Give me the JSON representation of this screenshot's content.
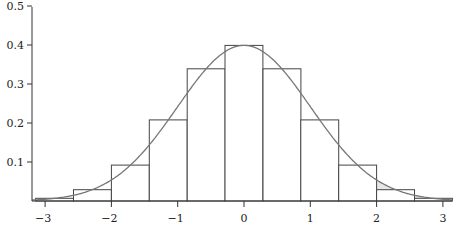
{
  "chart_data": {
    "type": "bar",
    "title": "",
    "xlabel": "",
    "ylabel": "",
    "bin_width": 0.5714,
    "bin_edges": [
      -3.143,
      -2.571,
      -2.0,
      -1.429,
      -0.857,
      -0.286,
      0.286,
      0.857,
      1.429,
      2.0,
      2.571,
      3.143
    ],
    "categories": [
      "-2.857",
      "-2.286",
      "-1.714",
      "-1.143",
      "-0.571",
      "0",
      "0.571",
      "1.143",
      "1.714",
      "2.286",
      "2.857"
    ],
    "values": [
      0.007,
      0.029,
      0.092,
      0.208,
      0.339,
      0.399,
      0.339,
      0.208,
      0.092,
      0.029,
      0.007
    ],
    "curve": {
      "name": "Normal density N(0,1)",
      "peak": 0.399
    },
    "shaded_region": {
      "from": 2.0,
      "to": 3.143,
      "color": "#e6e6e6"
    },
    "xlim": [
      -3.2,
      3.15
    ],
    "ylim": [
      0,
      0.5
    ],
    "x_ticks": [
      "−3",
      "−2",
      "−1",
      "0",
      "1",
      "2",
      "3"
    ],
    "x_tick_values": [
      -3,
      -2,
      -1,
      0,
      1,
      2,
      3
    ],
    "y_ticks": [
      "0.1",
      "0.2",
      "0.3",
      "0.4",
      "0.5"
    ],
    "y_tick_values": [
      0.1,
      0.2,
      0.3,
      0.4,
      0.5
    ],
    "grid": false,
    "legend": null,
    "colors": {
      "bar_stroke": "#444444",
      "bar_fill": "#ffffff",
      "curve": "#777777",
      "axis": "#333333"
    }
  }
}
